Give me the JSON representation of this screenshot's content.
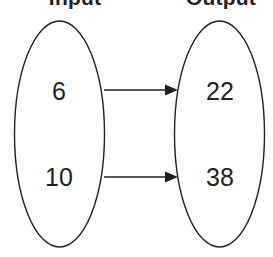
{
  "diagram": {
    "type": "mapping-diagram",
    "title": "",
    "background_color": "#ffffff",
    "stroke_color": "#231f20",
    "columns": {
      "input_heading": "Input",
      "output_heading": "Output"
    },
    "input_set": {
      "label": "Input",
      "values": [
        "6",
        "10"
      ]
    },
    "output_set": {
      "label": "Output",
      "values": [
        "22",
        "38"
      ]
    },
    "mappings": [
      {
        "from": "6",
        "to": "22"
      },
      {
        "from": "10",
        "to": "38"
      }
    ],
    "arrows": [
      {
        "name": "arrow-6-to-22",
        "x1": 104,
        "y1": 90,
        "x2": 177,
        "y2": 90
      },
      {
        "name": "arrow-10-to-38",
        "x1": 104,
        "y1": 177,
        "x2": 177,
        "y2": 177
      }
    ],
    "geometry": {
      "canvas_width": 273,
      "canvas_height": 257,
      "left_ellipse": {
        "cx": 59.5,
        "cy": 134,
        "rx": 45.5,
        "ry": 113
      },
      "right_ellipse": {
        "cx": 219.5,
        "cy": 134,
        "rx": 45.5,
        "ry": 113
      },
      "value_positions": [
        {
          "value": "6",
          "x": 59,
          "y": 91
        },
        {
          "value": "10",
          "x": 59,
          "y": 177
        },
        {
          "value": "22",
          "x": 220,
          "y": 91
        },
        {
          "value": "38",
          "x": 220,
          "y": 177
        }
      ]
    }
  }
}
